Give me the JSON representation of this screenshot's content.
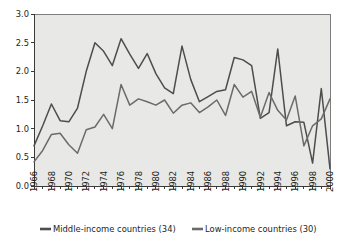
{
  "chart_data": {
    "type": "line",
    "title": "",
    "subtitle": "",
    "xlabel": "",
    "ylabel": "",
    "x": [
      1966,
      1967,
      1968,
      1969,
      1970,
      1971,
      1972,
      1973,
      1974,
      1975,
      1976,
      1977,
      1978,
      1979,
      1980,
      1981,
      1982,
      1983,
      1984,
      1985,
      1986,
      1987,
      1988,
      1989,
      1990,
      1991,
      1992,
      1993,
      1994,
      1995,
      1996,
      1997,
      1998,
      1999,
      2000
    ],
    "x_tick_labels": [
      "1966",
      "1968",
      "1970",
      "1972",
      "1974",
      "1976",
      "1978",
      "1980",
      "1982",
      "1984",
      "1986",
      "1988",
      "1990",
      "1992",
      "1994",
      "1996",
      "1998",
      "2000"
    ],
    "x_tick_step": 2,
    "y_tick_labels": [
      "0.0",
      "0.5",
      "1.0",
      "1.5",
      "2.0",
      "2.5",
      "3.0"
    ],
    "ylim": [
      0.0,
      3.0
    ],
    "xlim": [
      1966,
      2000
    ],
    "grid": false,
    "legend_position": "bottom",
    "series": [
      {
        "name": "Middle-income countries (34)",
        "color": "#4d4d4d",
        "values": [
          0.7,
          1.05,
          1.43,
          1.14,
          1.12,
          1.36,
          2.0,
          2.5,
          2.35,
          2.1,
          2.57,
          2.3,
          2.05,
          2.31,
          1.96,
          1.71,
          1.61,
          2.44,
          1.86,
          1.47,
          1.56,
          1.65,
          1.68,
          2.24,
          2.2,
          2.1,
          1.18,
          1.28,
          2.39,
          1.05,
          1.12,
          1.11,
          0.4,
          1.7,
          0.3
        ]
      },
      {
        "name": "Low-income countries (30)",
        "color": "#6b6b6b",
        "values": [
          0.42,
          0.62,
          0.9,
          0.92,
          0.72,
          0.57,
          0.98,
          1.03,
          1.25,
          1.0,
          1.77,
          1.41,
          1.52,
          1.47,
          1.41,
          1.5,
          1.27,
          1.41,
          1.45,
          1.28,
          1.38,
          1.5,
          1.23,
          1.77,
          1.55,
          1.65,
          1.2,
          1.63,
          1.32,
          1.15,
          1.57,
          0.7,
          1.05,
          1.17,
          1.52
        ]
      }
    ]
  },
  "legend": {
    "items": [
      {
        "label": "Middle-income countries (34)",
        "color": "#4d4d4d"
      },
      {
        "label": "Low-income countries (30)",
        "color": "#6b6b6b"
      }
    ]
  },
  "colors": {
    "plot_background": "#e8e8e6",
    "page_background": "#ffffff",
    "axis": "#3a3a3a",
    "text": "#231f20"
  }
}
